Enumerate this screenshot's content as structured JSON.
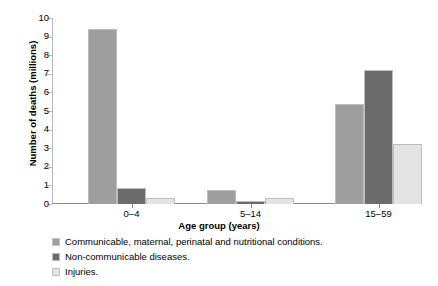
{
  "chart_data": {
    "type": "bar",
    "title": "",
    "subtitle": "",
    "xlabel": "Age group (years)",
    "ylabel": "Number of deaths (millions)",
    "categories": [
      "0–4",
      "5–14",
      "15–59"
    ],
    "series": [
      {
        "name": "Communicable, maternal, perinatal and nutritional conditions.",
        "color": "#9e9e9e",
        "values": [
          9.4,
          0.75,
          5.4
        ]
      },
      {
        "name": "Non-communicable diseases.",
        "color": "#6b6b6b",
        "values": [
          0.85,
          0.15,
          7.2
        ]
      },
      {
        "name": "Injuries.",
        "color": "#e3e3e3",
        "values": [
          0.3,
          0.3,
          3.25
        ]
      }
    ],
    "ylim": [
      0,
      10
    ],
    "yticks": [
      0,
      1,
      2,
      3,
      4,
      5,
      6,
      7,
      8,
      9,
      10
    ],
    "ytick_labels": [
      "0",
      "1",
      "2",
      "3",
      "4",
      "5",
      "6",
      "7",
      "8",
      "9",
      "10"
    ],
    "grid": false,
    "legend_position": "below"
  }
}
